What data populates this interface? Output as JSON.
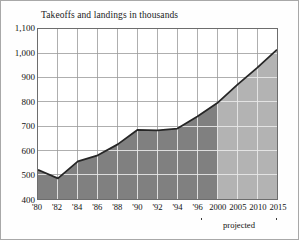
{
  "chart_data": {
    "type": "area",
    "title": "Takeoffs and landings in thousands",
    "xlabel": "",
    "ylabel": "",
    "ylim": [
      400,
      1100
    ],
    "ytick_step": 100,
    "ytick_labels": [
      "1,100",
      "1,000",
      "900",
      "800",
      "700",
      "600",
      "500",
      "400"
    ],
    "ytick_values": [
      1100,
      1000,
      900,
      800,
      700,
      600,
      500,
      400
    ],
    "xtick_labels": [
      "'80",
      "'82",
      "'84",
      "'86",
      "'88",
      "'90",
      "'92",
      "'94",
      "'96",
      "2000",
      "2005",
      "2010",
      "2015"
    ],
    "x": [
      1980,
      1982,
      1984,
      1986,
      1988,
      1990,
      1992,
      1994,
      1996,
      2000,
      2005,
      2010,
      2015
    ],
    "values": [
      520,
      485,
      555,
      580,
      625,
      685,
      683,
      690,
      740,
      795,
      870,
      940,
      1015
    ],
    "grid": true,
    "legend_position": "none",
    "annotation": "projected",
    "projection_start_year": 2000,
    "colors": {
      "actual_fill": "#808080",
      "projected_fill": "#b3b3b3",
      "line": "#262626",
      "grid": "#9a9a9a",
      "grid_on_fill": "#e8e8e8",
      "frame": "#6d6d6d",
      "background": "#ffffff",
      "text": "#111111"
    }
  },
  "figure": {
    "title": "Takeoffs and landings in thousands",
    "projected_label": "projected"
  }
}
